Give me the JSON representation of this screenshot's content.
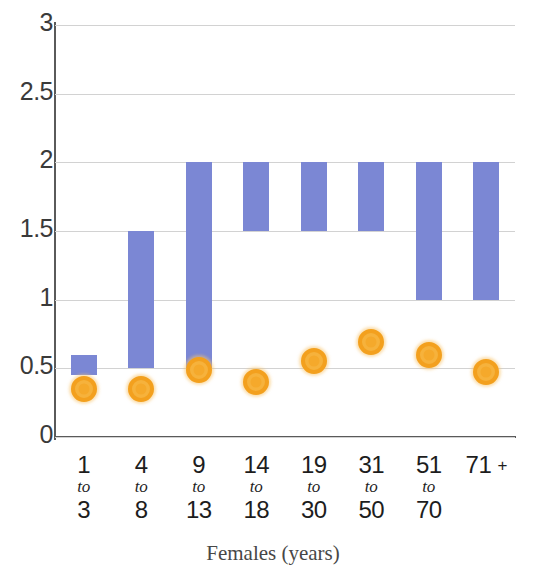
{
  "chart_data": {
    "type": "bar",
    "subtype": "floating-range-bar-with-scatter-overlay",
    "title": "",
    "xlabel": "Females (years)",
    "ylabel": "",
    "ylim": [
      0,
      3
    ],
    "yticks": [
      "0",
      "0.5",
      "1",
      "1.5",
      "2",
      "2.5",
      "3"
    ],
    "ytick_values": [
      0,
      0.5,
      1,
      1.5,
      2,
      2.5,
      3
    ],
    "grid": true,
    "legend": "none",
    "colors": {
      "bar": "#7b87d4",
      "marker_fill": "#f6b23c",
      "marker_ring": "#f3a01e",
      "gridline": "#d2d2d2",
      "axis": "#5a5a5a",
      "text": "#1d1d1d"
    },
    "categories": [
      {
        "from": "1",
        "to_word": "to",
        "to": "3",
        "label": "1 to 3"
      },
      {
        "from": "4",
        "to_word": "to",
        "to": "8",
        "label": "4 to 8"
      },
      {
        "from": "9",
        "to_word": "to",
        "to": "13",
        "label": "9 to 13"
      },
      {
        "from": "14",
        "to_word": "to",
        "to": "18",
        "label": "14 to 18"
      },
      {
        "from": "19",
        "to_word": "to",
        "to": "30",
        "label": "19 to 30"
      },
      {
        "from": "31",
        "to_word": "to",
        "to": "50",
        "label": "31 to 50"
      },
      {
        "from": "51",
        "to_word": "to",
        "to": "70",
        "label": "51 to 70"
      },
      {
        "from": "71",
        "to_word": "+",
        "to": "",
        "label": "71 +"
      }
    ],
    "series": [
      {
        "name": "range",
        "type": "range-bar",
        "low": [
          0.45,
          0.5,
          0.5,
          1.5,
          1.5,
          1.5,
          1.0,
          1.0
        ],
        "high": [
          0.6,
          1.5,
          2.0,
          2.0,
          2.0,
          2.0,
          2.0,
          2.0
        ]
      },
      {
        "name": "point",
        "type": "scatter",
        "values": [
          0.35,
          0.35,
          0.49,
          0.4,
          0.55,
          0.69,
          0.6,
          0.47
        ]
      }
    ]
  }
}
